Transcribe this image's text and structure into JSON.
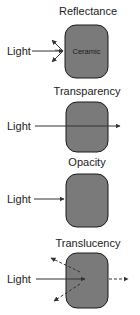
{
  "diagram": {
    "colors": {
      "box_fill": "#7a7a7a",
      "box_stroke": "#1a1a1a",
      "line": "#333333",
      "text": "#222222"
    },
    "panels": [
      {
        "title": "Reflectance",
        "source_label": "Light",
        "material_label": "Ceramic",
        "behavior": "reflect"
      },
      {
        "title": "Transparency",
        "source_label": "Light",
        "material_label": "",
        "behavior": "transmit"
      },
      {
        "title": "Opacity",
        "source_label": "Light",
        "material_label": "",
        "behavior": "absorb"
      },
      {
        "title": "Translucency",
        "source_label": "Light",
        "material_label": "",
        "behavior": "scatter"
      }
    ]
  }
}
